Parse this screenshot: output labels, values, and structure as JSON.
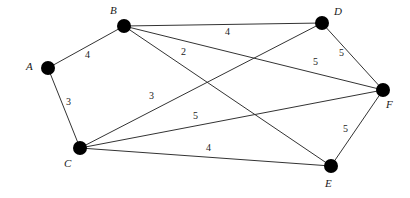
{
  "graph": {
    "title": "Weighted undirected graph",
    "background_color": "#ffffff",
    "node_color": "#000000",
    "edge_color": "#333333",
    "node_radius": 7,
    "nodes": [
      {
        "id": "A",
        "label": "A",
        "x": 48,
        "y": 68,
        "label_x": 26,
        "label_y": 61
      },
      {
        "id": "B",
        "label": "B",
        "x": 124,
        "y": 26,
        "label_x": 110,
        "label_y": 5
      },
      {
        "id": "C",
        "label": "C",
        "x": 80,
        "y": 148,
        "label_x": 64,
        "label_y": 158
      },
      {
        "id": "D",
        "label": "D",
        "x": 322,
        "y": 23,
        "label_x": 334,
        "label_y": 6
      },
      {
        "id": "E",
        "label": "E",
        "x": 331,
        "y": 166,
        "label_x": 325,
        "label_y": 178
      },
      {
        "id": "F",
        "label": "F",
        "x": 383,
        "y": 90,
        "label_x": 386,
        "label_y": 99
      }
    ],
    "edges": [
      {
        "from": "A",
        "to": "B",
        "weight": "4",
        "label_x": 85,
        "label_y": 50
      },
      {
        "from": "A",
        "to": "C",
        "weight": "3",
        "label_x": 66,
        "label_y": 97
      },
      {
        "from": "B",
        "to": "D",
        "weight": "4",
        "label_x": 225,
        "label_y": 27
      },
      {
        "from": "B",
        "to": "F",
        "weight": "2",
        "label_x": 181,
        "label_y": 47
      },
      {
        "from": "B",
        "to": "E",
        "weight": "5",
        "label_x": 193,
        "label_y": 111
      },
      {
        "from": "C",
        "to": "D",
        "weight": "3",
        "label_x": 149,
        "label_y": 91
      },
      {
        "from": "C",
        "to": "F",
        "weight": "5",
        "label_x": 313,
        "label_y": 57
      },
      {
        "from": "C",
        "to": "E",
        "weight": "4",
        "label_x": 206,
        "label_y": 143
      },
      {
        "from": "D",
        "to": "F",
        "weight": "5",
        "label_x": 339,
        "label_y": 48
      },
      {
        "from": "E",
        "to": "F",
        "weight": "5",
        "label_x": 343,
        "label_y": 124
      }
    ]
  }
}
